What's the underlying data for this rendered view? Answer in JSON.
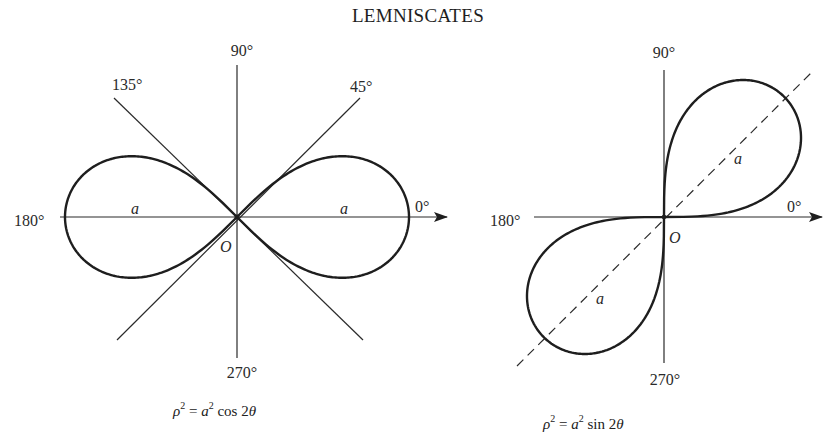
{
  "title": "LEMNISCATES",
  "figures": [
    {
      "id": "cos",
      "equation": {
        "rho": "ρ",
        "exp": "2",
        "eq": " = ",
        "a": "a",
        "exp2": "2",
        "fn": " cos 2",
        "theta": "θ"
      },
      "angle_labels": {
        "deg90": "90°",
        "deg45": "45°",
        "deg135": "135°",
        "deg0": "0°",
        "deg180": "180°",
        "deg270": "270°"
      },
      "origin_label": "O",
      "radius_labels": [
        "a",
        "a"
      ]
    },
    {
      "id": "sin",
      "equation": {
        "rho": "ρ",
        "exp": "2",
        "eq": " = ",
        "a": "a",
        "exp2": "2",
        "fn": " sin 2",
        "theta": "θ"
      },
      "angle_labels": {
        "deg90": "90°",
        "deg0": "0°",
        "deg180": "180°",
        "deg270": "270°"
      },
      "origin_label": "O",
      "radius_labels": [
        "a",
        "a"
      ]
    }
  ],
  "chart_data": {
    "type": "diagram",
    "title": "LEMNISCATES",
    "plots": [
      {
        "curve": "ρ² = a² cos 2θ",
        "kind": "lemniscate",
        "orientation": "horizontal lobes along 0°/180°",
        "tangent_lines_at_origin": [
          "45°",
          "135°"
        ],
        "axes_labels": [
          "0°",
          "90°",
          "180°",
          "270°",
          "45°",
          "135°"
        ],
        "origin": [
          237,
          217
        ],
        "a_px": 172
      },
      {
        "curve": "ρ² = a² sin 2θ",
        "kind": "lemniscate",
        "orientation": "lobes along 45°/225° (dashed axis)",
        "axes_labels": [
          "0°",
          "90°",
          "180°",
          "270°"
        ],
        "origin": [
          664,
          217
        ],
        "a_px": 170
      }
    ]
  }
}
